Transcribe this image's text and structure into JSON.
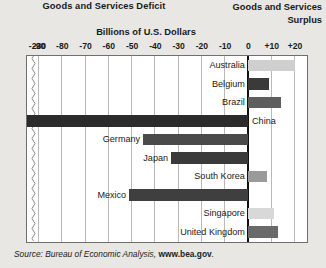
{
  "header": {
    "deficit_title": "Goods and Services Deficit",
    "surplus_title_line1": "Goods and Services",
    "surplus_title_line2": "Surplus"
  },
  "axis_title": "Billions of U.S. Dollars",
  "source": {
    "prefix": "Source: Bureau of Economic Analysis, ",
    "site": "www.bea.gov",
    "suffix": "."
  },
  "chart_data": {
    "type": "bar",
    "orientation": "horizontal",
    "title": "Billions of U.S. Dollars",
    "xlabel": "Billions of U.S. Dollars",
    "ylabel": "",
    "xlim": [
      -95,
      25
    ],
    "grid": true,
    "legend": "none",
    "axis_break": {
      "at": -92,
      "label_beyond": "-230"
    },
    "tick_labels": [
      "-230",
      "-90",
      "-80",
      "-70",
      "-60",
      "-50",
      "-40",
      "-30",
      "-20",
      "-10",
      "0",
      "+10",
      "+20"
    ],
    "tick_values": [
      -230,
      -90,
      -80,
      -70,
      -60,
      -50,
      -40,
      -30,
      -20,
      -10,
      0,
      10,
      20
    ],
    "categories": [
      "Australia",
      "Belgium",
      "Brazil",
      "China",
      "Germany",
      "Japan",
      "South Korea",
      "Mexico",
      "Singapore",
      "United Kingdom"
    ],
    "values": [
      20,
      9,
      14,
      -230,
      -45,
      -33,
      8,
      -51,
      11,
      13
    ],
    "bars": [
      {
        "label": "Australia",
        "value": 20,
        "shade": "#cfcfcf",
        "side": "surplus",
        "label_side": "left"
      },
      {
        "label": "Belgium",
        "value": 9,
        "shade": "#3a3a3a",
        "side": "surplus",
        "label_side": "left"
      },
      {
        "label": "Brazil",
        "value": 14,
        "shade": "#5e5e5e",
        "side": "surplus",
        "label_side": "left"
      },
      {
        "label": "China",
        "value": -230,
        "shade": "#2b2b2b",
        "side": "deficit",
        "label_side": "right"
      },
      {
        "label": "Germany",
        "value": -45,
        "shade": "#4a4a4a",
        "side": "deficit",
        "label_side": "left"
      },
      {
        "label": "Japan",
        "value": -33,
        "shade": "#3a3a3a",
        "side": "deficit",
        "label_side": "left"
      },
      {
        "label": "South Korea",
        "value": 8,
        "shade": "#9a9a9a",
        "side": "surplus",
        "label_side": "left"
      },
      {
        "label": "Mexico",
        "value": -51,
        "shade": "#3f3f3f",
        "side": "deficit",
        "label_side": "left"
      },
      {
        "label": "Singapore",
        "value": 11,
        "shade": "#d8d8d8",
        "side": "surplus",
        "label_side": "left"
      },
      {
        "label": "United Kingdom",
        "value": 13,
        "shade": "#6a6a6a",
        "side": "surplus",
        "label_side": "left"
      }
    ]
  },
  "colors": {
    "page_background": "#e8e7e4",
    "plot_background": "#ffffff",
    "frame": "#6f6f6f",
    "gridline": "#b9b9b9",
    "zero_axis": "#111111",
    "text": "#1a1a1a"
  }
}
